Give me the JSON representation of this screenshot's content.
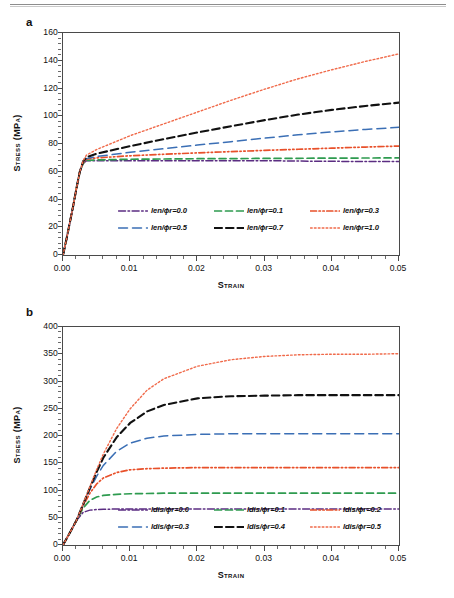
{
  "figure": {
    "panels": [
      {
        "letter": "a",
        "xlabel": "Strain",
        "ylabel": "Stress (MPa)",
        "yticks": [
          "0",
          "20",
          "40",
          "60",
          "80",
          "100",
          "120",
          "140",
          "160"
        ],
        "xticks": [
          "0.00",
          "0.01",
          "0.02",
          "0.03",
          "0.04",
          "0.05"
        ],
        "legend": [
          {
            "label": "len/ϕr=0.0",
            "color": "#5b2d82",
            "dash": "dashdot"
          },
          {
            "label": "len/ϕr=0.1",
            "color": "#2e9b4f",
            "dash": "dashed"
          },
          {
            "label": "len/ϕr=0.3",
            "color": "#e8502a",
            "dash": "dashdotdot"
          },
          {
            "label": "len/ϕr=0.5",
            "color": "#3b6fb5",
            "dash": "longdash"
          },
          {
            "label": "len/ϕr=0.7",
            "color": "#111111",
            "dash": "thickdash"
          },
          {
            "label": "len/ϕr=1.0",
            "color": "#f06a4a",
            "dash": "dotted"
          }
        ]
      },
      {
        "letter": "b",
        "xlabel": "Strain",
        "ylabel": "Stress (MPa)",
        "yticks": [
          "0",
          "50",
          "100",
          "150",
          "200",
          "250",
          "300",
          "350",
          "400"
        ],
        "xticks": [
          "0.00",
          "0.01",
          "0.02",
          "0.03",
          "0.04",
          "0.05"
        ],
        "legend": [
          {
            "label": "ldis/ϕr=0.0",
            "color": "#5b2d82",
            "dash": "dashdot"
          },
          {
            "label": "ldis/ϕr=0.1",
            "color": "#2e9b4f",
            "dash": "dashed"
          },
          {
            "label": "ldis/ϕr=0.2",
            "color": "#e8502a",
            "dash": "dashdotdot"
          },
          {
            "label": "ldis/ϕr=0.3",
            "color": "#3b6fb5",
            "dash": "longdash"
          },
          {
            "label": "ldis/ϕr=0.4",
            "color": "#111111",
            "dash": "thickdash"
          },
          {
            "label": "ldis/ϕr=0.5",
            "color": "#f06a4a",
            "dash": "dotted"
          }
        ]
      }
    ]
  },
  "chart_data": [
    {
      "type": "line",
      "title": "a",
      "xlabel": "Strain",
      "ylabel": "Stress (MPa)",
      "xlim": [
        0.0,
        0.05
      ],
      "ylim": [
        0,
        160
      ],
      "xticks": [
        0.0,
        0.01,
        0.02,
        0.03,
        0.04,
        0.05
      ],
      "yticks": [
        0,
        20,
        40,
        60,
        80,
        100,
        120,
        140,
        160
      ],
      "grid": false,
      "legend_position": "inside-lower-center",
      "x": [
        0.0,
        0.0005,
        0.001,
        0.0015,
        0.002,
        0.0025,
        0.003,
        0.0035,
        0.005,
        0.01,
        0.015,
        0.02,
        0.025,
        0.03,
        0.035,
        0.04,
        0.045,
        0.05
      ],
      "series": [
        {
          "name": "len/ϕr=0.0",
          "color": "#5b2d82",
          "values": [
            0,
            11,
            23,
            35,
            48,
            60,
            66,
            68,
            68,
            68,
            68,
            68,
            68,
            68,
            67.7,
            67.5,
            67.4,
            67.3
          ]
        },
        {
          "name": "len/ϕr=0.1",
          "color": "#2e9b4f",
          "values": [
            0,
            11,
            23,
            35,
            48,
            60,
            66,
            68.2,
            68.5,
            69,
            69.2,
            69.4,
            69.5,
            69.6,
            69.7,
            69.8,
            69.9,
            70
          ]
        },
        {
          "name": "len/ϕr=0.3",
          "color": "#e8502a",
          "values": [
            0,
            11,
            23,
            35,
            48,
            60,
            66.5,
            69,
            70,
            71.5,
            72.6,
            73.6,
            74.5,
            75.4,
            76.2,
            77,
            77.8,
            78.5
          ]
        },
        {
          "name": "len/ϕr=0.5",
          "color": "#3b6fb5",
          "values": [
            0,
            11,
            23,
            35,
            48,
            60,
            67,
            69.5,
            71,
            74,
            76.6,
            79.2,
            81.7,
            84.2,
            86.6,
            88.7,
            90.5,
            92
          ]
        },
        {
          "name": "len/ϕr=0.7",
          "color": "#111111",
          "values": [
            0,
            11,
            23,
            35,
            48,
            60,
            67.5,
            70.5,
            73,
            78.5,
            83.5,
            88.3,
            92.8,
            97.2,
            101.2,
            104.6,
            107.4,
            109.8
          ]
        },
        {
          "name": "len/ϕr=1.0",
          "color": "#f06a4a",
          "values": [
            0,
            11,
            23,
            35,
            48,
            60,
            68,
            72,
            76,
            86,
            94.5,
            103,
            111.5,
            119.5,
            127,
            133.5,
            139.5,
            145
          ]
        }
      ]
    },
    {
      "type": "line",
      "title": "b",
      "xlabel": "Strain",
      "ylabel": "Stress (MPa)",
      "xlim": [
        0.0,
        0.05
      ],
      "ylim": [
        0,
        400
      ],
      "xticks": [
        0.0,
        0.01,
        0.02,
        0.03,
        0.04,
        0.05
      ],
      "yticks": [
        0,
        50,
        100,
        150,
        200,
        250,
        300,
        350,
        400
      ],
      "grid": false,
      "legend_position": "inside-lower-center",
      "x": [
        0.0,
        0.001,
        0.002,
        0.003,
        0.004,
        0.005,
        0.006,
        0.008,
        0.01,
        0.0125,
        0.015,
        0.02,
        0.025,
        0.03,
        0.035,
        0.04,
        0.045,
        0.05
      ],
      "series": [
        {
          "name": "ldis/ϕr=0.0",
          "color": "#5b2d82",
          "values": [
            0,
            22,
            45,
            60,
            64,
            65,
            65.5,
            66,
            66,
            66,
            66,
            66,
            66,
            66,
            66,
            66,
            66,
            66
          ]
        },
        {
          "name": "ldis/ϕr=0.1",
          "color": "#2e9b4f",
          "values": [
            0,
            22,
            45,
            68,
            82,
            88,
            91,
            93,
            94,
            94.5,
            95,
            95,
            95,
            95,
            95,
            95,
            95,
            95
          ]
        },
        {
          "name": "ldis/ϕr=0.2",
          "color": "#e8502a",
          "values": [
            0,
            22,
            45,
            72,
            95,
            112,
            123,
            133,
            138,
            140,
            141,
            142,
            142,
            142,
            142,
            142,
            142,
            142
          ]
        },
        {
          "name": "ldis/ϕr=0.3",
          "color": "#3b6fb5",
          "values": [
            0,
            22,
            45,
            74,
            102,
            126,
            146,
            172,
            187,
            196,
            200,
            203,
            204,
            204,
            204,
            204,
            204,
            204
          ]
        },
        {
          "name": "ldis/ϕr=0.4",
          "color": "#111111",
          "values": [
            0,
            22,
            45,
            75,
            105,
            134,
            160,
            198,
            224,
            245,
            257,
            269,
            273,
            274,
            275,
            275,
            275,
            275
          ]
        },
        {
          "name": "ldis/ϕr=0.5",
          "color": "#f06a4a",
          "values": [
            0,
            22,
            45,
            76,
            107,
            138,
            167,
            214,
            250,
            284,
            305,
            328,
            340,
            346,
            349,
            350,
            350,
            351
          ]
        }
      ]
    }
  ]
}
